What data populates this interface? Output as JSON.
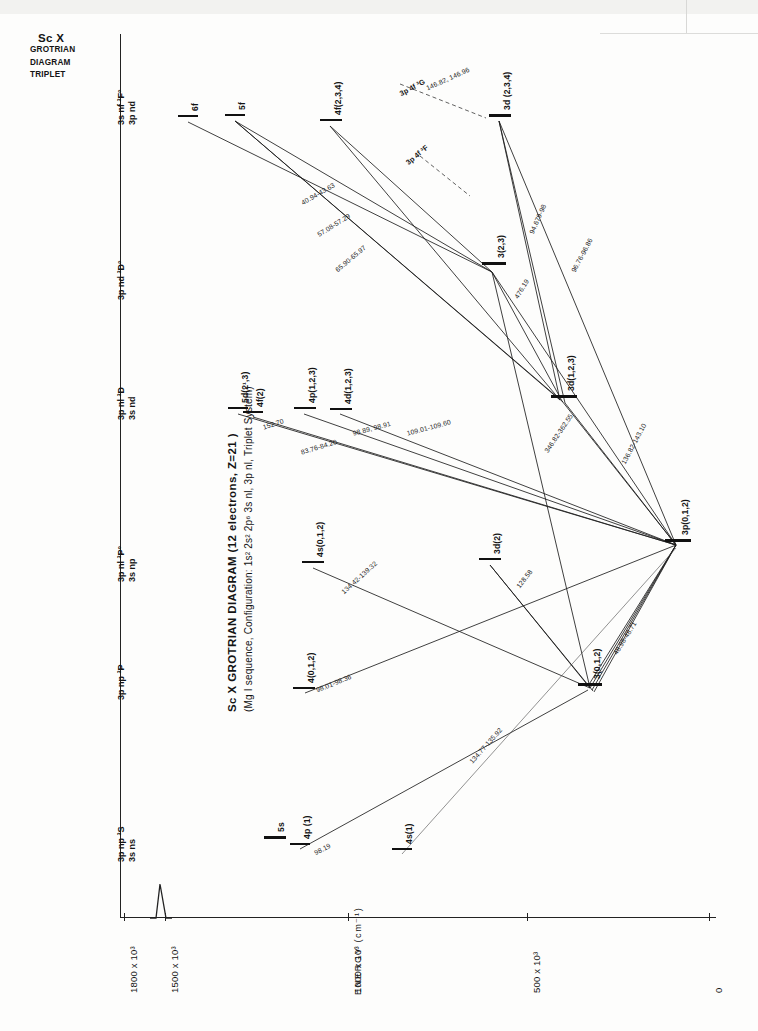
{
  "corner_stamp": {
    "element": "Sc X",
    "line2": "GROTRIAN",
    "line3": "DIAGRAM",
    "line4": "TRIPLET"
  },
  "title": {
    "main": "Sc X  GROTRIAN  DIAGRAM  (12 electrons, Z=21 )",
    "sub": "(Mg I sequence,   Configuration: 1s² 2s² 2p⁶ 3s nl, 3p nl, Triplet  System)"
  },
  "axes": {
    "y_label": "ENERGY  (cm⁻¹)",
    "y_ticks": [
      "1800 x 10³",
      "1500 x 10³",
      "1000 x 10³",
      "500 x 10³",
      "0"
    ],
    "y_tick_values": [
      1800000,
      1500000,
      1000000,
      500000,
      0
    ],
    "has_axis_break": true
  },
  "column_headers": [
    {
      "id": "col-3s-ns",
      "line1": "3p np ³S",
      "line2": "3s ns"
    },
    {
      "id": "col-3p-np-3P",
      "line1": "3p np ³P",
      "line2": ""
    },
    {
      "id": "col-3s-np",
      "line1": "3p nl ³P°",
      "line2": "3s np"
    },
    {
      "id": "col-3s-nd",
      "line1": "3p nl ³D",
      "line2": "3s nd"
    },
    {
      "id": "col-3p-nd-3Do",
      "line1": "3p nd ³D°",
      "line2": ""
    },
    {
      "id": "col-3s-nf",
      "line1": "3s nf ³F°",
      "line2": "3p nd"
    }
  ],
  "chart_data": {
    "type": "diagram",
    "xlabel": "",
    "ylabel": "ENERGY (cm⁻¹)",
    "ylim": [
      0,
      1800000
    ],
    "grid": false,
    "legend": "none",
    "levels": [
      {
        "label": "5s",
        "column": "3s ns ³S",
        "term": "³S"
      },
      {
        "label": "4p (1)",
        "column": "3s ns ³S",
        "term": "³S"
      },
      {
        "label": "4s(1)",
        "column": "3s ns ³S",
        "term": "³S"
      },
      {
        "label": "4(0,1,2)",
        "column": "3p np ³P",
        "term": "³P"
      },
      {
        "label": "3(0,1,2)",
        "column": "3p np ³P",
        "term": "³P"
      },
      {
        "label": "4s(0,1,2)",
        "column": "3s np ³P°",
        "term": "³P°"
      },
      {
        "label": "3d(2)",
        "column": "3s np ³P°",
        "term": "³P°"
      },
      {
        "label": "3p(0,1,2)",
        "column": "3s np ³P°",
        "term": "³P°"
      },
      {
        "label": "5d(2¹,3)",
        "column": "3s nd ³D",
        "term": "³D"
      },
      {
        "label": "4f(2)",
        "column": "3s nd ³D",
        "term": "³D"
      },
      {
        "label": "4p(1,2,3)",
        "column": "3s nd ³D",
        "term": "³D"
      },
      {
        "label": "4d(1,2,3)",
        "column": "3s nd ³D",
        "term": "³D"
      },
      {
        "label": "3d(1,2,3)",
        "column": "3s nd ³D",
        "term": "³D"
      },
      {
        "label": "3(2,3)",
        "column": "3p nd ³D°",
        "term": "³D°"
      },
      {
        "label": "6f",
        "column": "3s nf ³F°",
        "term": "³F°"
      },
      {
        "label": "5f",
        "column": "3s nf ³F°",
        "term": "³F°"
      },
      {
        "label": "4f(2,3,4)",
        "column": "3s nf ³F°",
        "term": "³F°"
      },
      {
        "label": "3d (2,3,4)",
        "column": "3s nf ³F°",
        "term": "³F°"
      }
    ],
    "transitions": [
      {
        "label": "98.19"
      },
      {
        "label": "98.01-98.36"
      },
      {
        "label": "134.77-135.92"
      },
      {
        "label": "152.70"
      },
      {
        "label": "83.76-84.20"
      },
      {
        "label": "98.89, 98.91"
      },
      {
        "label": "109.01-109.60"
      },
      {
        "label": "134.42-139.32"
      },
      {
        "label": "128.58"
      },
      {
        "label": "48.98-48.71"
      },
      {
        "label": "96.76-96.86"
      },
      {
        "label": "476.19"
      },
      {
        "label": "94.679-98"
      },
      {
        "label": "40.94-43.63"
      },
      {
        "label": "57.08-57.29"
      },
      {
        "label": "65.90-65.97"
      },
      {
        "label": "136.82-143.10"
      },
      {
        "label": "346.82-362.55"
      },
      {
        "label": "146.82, 146.96"
      }
    ],
    "annotations": [
      {
        "label": "3p 4f ³G"
      },
      {
        "label": "3p 4f ³F"
      }
    ]
  },
  "levels_geom": [
    {
      "name": "level-5s",
      "label": "5s",
      "x": 264,
      "y": 836,
      "w": 22,
      "thick": true,
      "lx": 276,
      "ly": 832
    },
    {
      "name": "level-4p-1",
      "label": "4p (1)",
      "x": 290,
      "y": 843,
      "w": 20,
      "thick": false,
      "lx": 302,
      "ly": 839
    },
    {
      "name": "level-4s-1",
      "label": "4s(1)",
      "x": 392,
      "y": 848,
      "w": 20,
      "thick": false,
      "lx": 404,
      "ly": 844
    },
    {
      "name": "level-4-012",
      "label": "4(0,1,2)",
      "x": 293,
      "y": 687,
      "w": 22,
      "thick": false,
      "lx": 306,
      "ly": 683
    },
    {
      "name": "level-3-012",
      "label": "3(0,1,2)",
      "x": 578,
      "y": 683,
      "w": 24,
      "thick": true,
      "lx": 592,
      "ly": 679
    },
    {
      "name": "level-4s-012",
      "label": "4s(0,1,2)",
      "x": 302,
      "y": 561,
      "w": 22,
      "thick": false,
      "lx": 315,
      "ly": 557
    },
    {
      "name": "level-3d-2",
      "label": "3d(2)",
      "x": 479,
      "y": 558,
      "w": 22,
      "thick": false,
      "lx": 492,
      "ly": 554
    },
    {
      "name": "level-3p-012",
      "label": "3p(0,1,2)",
      "x": 665,
      "y": 539,
      "w": 26,
      "thick": true,
      "lx": 680,
      "ly": 535
    },
    {
      "name": "level-5d-213",
      "label": "5d(2¹,3)",
      "x": 228,
      "y": 407,
      "w": 20,
      "thick": false,
      "lx": 240,
      "ly": 403
    },
    {
      "name": "level-4f-2",
      "label": "4f(2)",
      "x": 243,
      "y": 411,
      "w": 20,
      "thick": false,
      "lx": 255,
      "ly": 407
    },
    {
      "name": "level-4p-123",
      "label": "4p(1,2,3)",
      "x": 294,
      "y": 407,
      "w": 22,
      "thick": false,
      "lx": 307,
      "ly": 403
    },
    {
      "name": "level-4d-123",
      "label": "4d(1,2,3)",
      "x": 330,
      "y": 408,
      "w": 22,
      "thick": false,
      "lx": 343,
      "ly": 404
    },
    {
      "name": "level-3d-123",
      "label": "3d(1,2,3)",
      "x": 551,
      "y": 395,
      "w": 26,
      "thick": true,
      "lx": 566,
      "ly": 391
    },
    {
      "name": "level-3-23",
      "label": "3(2,3)",
      "x": 482,
      "y": 262,
      "w": 24,
      "thick": true,
      "lx": 496,
      "ly": 258
    },
    {
      "name": "level-6f",
      "label": "6f",
      "x": 178,
      "y": 115,
      "w": 20,
      "thick": false,
      "lx": 190,
      "ly": 111
    },
    {
      "name": "level-5f",
      "label": "5f",
      "x": 225,
      "y": 114,
      "w": 20,
      "thick": false,
      "lx": 237,
      "ly": 110
    },
    {
      "name": "level-4f-234",
      "label": "4f(2,3,4)",
      "x": 320,
      "y": 119,
      "w": 22,
      "thick": false,
      "lx": 333,
      "ly": 115
    },
    {
      "name": "level-3d-234",
      "label": "3d (2,3,4)",
      "x": 489,
      "y": 114,
      "w": 22,
      "thick": true,
      "lx": 502,
      "ly": 110
    }
  ]
}
